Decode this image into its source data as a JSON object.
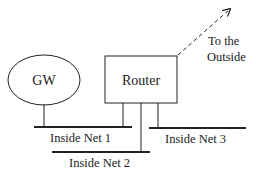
{
  "diagram": {
    "nodes": {
      "gateway": {
        "label": "GW"
      },
      "router": {
        "label": "Router"
      }
    },
    "external": {
      "line1": "To the",
      "line2": "Outside"
    },
    "networks": [
      {
        "label": "Inside Net 1"
      },
      {
        "label": "Inside Net 2"
      },
      {
        "label": "Inside Net 3"
      }
    ],
    "colors": {
      "stroke": "#222222",
      "background": "#ffffff"
    }
  }
}
